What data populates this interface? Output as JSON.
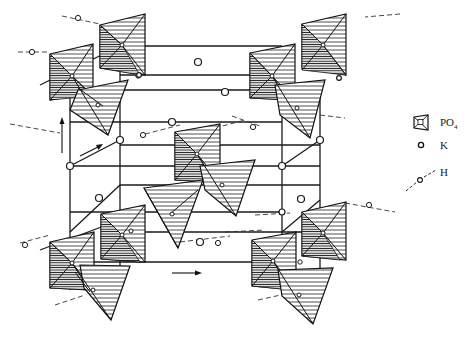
{
  "figure": {
    "background_color": "#ffffff",
    "line_color": "#1a1a1a"
  },
  "legend": {
    "items": [
      {
        "symbol": "tetrahedron-icon",
        "label": "PO",
        "subscript": "4"
      },
      {
        "symbol": "open-circle-icon",
        "label": "K",
        "subscript": ""
      },
      {
        "symbol": "dashed-line-circle-icon",
        "label": "H",
        "subscript": ""
      }
    ]
  },
  "annotations": {
    "vertical_arrow": "up arrow at left (c-axis)",
    "diagonal_arrow": "diagonal arrow (b-axis)",
    "horizontal_arrow": "right arrow at bottom (a-axis)"
  }
}
